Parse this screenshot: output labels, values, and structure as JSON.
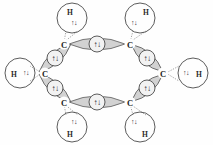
{
  "diagram": {
    "molecule_formula": "C6H6",
    "carbon_label": "C",
    "hydrogen_label": "H",
    "electron_pair_symbol": "↑↓",
    "colors": {
      "lens_fill": "#d2d2d2",
      "lens_stroke": "#5a5a5a",
      "circle_fill": "#f2f2f2",
      "circle_stroke": "#4a4a4a",
      "dotted_bond": "#7d7d7d",
      "text": "#1a1a1a",
      "background": "#fefefe"
    },
    "carbon_atoms": [
      {
        "id": "c-top-left",
        "label": "C",
        "x": 64,
        "y": 44
      },
      {
        "id": "c-top-right",
        "label": "C",
        "x": 130,
        "y": 44
      },
      {
        "id": "c-right",
        "label": "C",
        "x": 163,
        "y": 73
      },
      {
        "id": "c-bottom-right",
        "label": "C",
        "x": 130,
        "y": 102
      },
      {
        "id": "c-bottom-left",
        "label": "C",
        "x": 64,
        "y": 102
      },
      {
        "id": "c-left",
        "label": "C",
        "x": 45,
        "y": 73
      }
    ],
    "cc_bonds": [
      {
        "id": "bond-top",
        "from": "c-top-left",
        "to": "c-top-right",
        "electrons": "↑↓",
        "cx": 97,
        "cy": 44,
        "angle": 0
      },
      {
        "id": "bond-upper-right",
        "from": "c-top-right",
        "to": "c-right",
        "electrons": "↑↓",
        "cx": 147,
        "cy": 58,
        "angle": 41
      },
      {
        "id": "bond-lower-right",
        "from": "c-right",
        "to": "c-bottom-right",
        "electrons": "↑↓",
        "cx": 147,
        "cy": 88,
        "angle": -41
      },
      {
        "id": "bond-bottom",
        "from": "c-bottom-right",
        "to": "c-bottom-left",
        "electrons": "↑↓",
        "cx": 97,
        "cy": 102,
        "angle": 0
      },
      {
        "id": "bond-lower-left",
        "from": "c-bottom-left",
        "to": "c-left",
        "electrons": "↑↓",
        "cx": 55,
        "cy": 88,
        "angle": 41
      },
      {
        "id": "bond-upper-left",
        "from": "c-left",
        "to": "c-top-left",
        "electrons": "↑↓",
        "cx": 55,
        "cy": 58,
        "angle": -41
      }
    ],
    "hydrogen_groups": [
      {
        "id": "h-top-left",
        "label": "H",
        "electrons": "↑↓",
        "cx": 72,
        "cy": 18,
        "r": 15,
        "label_x": 70,
        "label_y": 12,
        "spin_x": 74,
        "spin_y": 23,
        "carbon": "c-top-left"
      },
      {
        "id": "h-top-right",
        "label": "H",
        "electrons": "↑↓",
        "cx": 140,
        "cy": 18,
        "r": 15,
        "label_x": 146,
        "label_y": 12,
        "spin_x": 134,
        "spin_y": 23,
        "carbon": "c-top-right"
      },
      {
        "id": "h-right",
        "label": "H",
        "electrons": "↑↓",
        "cx": 193,
        "cy": 73,
        "r": 15,
        "label_x": 199,
        "label_y": 74,
        "spin_x": 186,
        "spin_y": 73,
        "carbon": "c-right"
      },
      {
        "id": "h-bottom-right",
        "label": "H",
        "electrons": "↑↓",
        "cx": 140,
        "cy": 127,
        "r": 15,
        "label_x": 145,
        "label_y": 134,
        "spin_x": 134,
        "spin_y": 122,
        "carbon": "c-bottom-right"
      },
      {
        "id": "h-bottom-left",
        "label": "H",
        "electrons": "↑↓",
        "cx": 72,
        "cy": 127,
        "r": 15,
        "label_x": 70,
        "label_y": 134,
        "spin_x": 74,
        "spin_y": 122,
        "carbon": "c-bottom-left"
      },
      {
        "id": "h-left",
        "label": "H",
        "electrons": "↑↓",
        "cx": 20,
        "cy": 73,
        "r": 15,
        "label_x": 14,
        "label_y": 74,
        "spin_x": 26,
        "spin_y": 73,
        "carbon": "c-left"
      }
    ],
    "counts": {
      "carbons": 6,
      "hydrogens": 6,
      "cc_sigma_bonds": 6,
      "ch_sigma_bonds": 6,
      "total_electron_pairs_shown": 12
    }
  }
}
